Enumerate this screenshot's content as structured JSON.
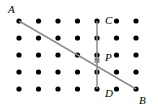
{
  "figure": {
    "type": "geometry-dot-grid",
    "width": 158,
    "height": 110,
    "background_color": "#ffffff",
    "grid": {
      "columns": 7,
      "rows": 5,
      "origin_x": 19,
      "origin_y": 21,
      "spacing_x": 19.5,
      "spacing_y": 17,
      "dot_radius": 2.6,
      "dot_color": "#000000"
    },
    "segments": [
      {
        "name": "segment-AB",
        "from": "A",
        "to": "B",
        "from_col": 1,
        "from_row": 1,
        "to_col": 7,
        "to_row": 5,
        "color": "#8c8c8c",
        "width": 1.5
      },
      {
        "name": "segment-CD",
        "from": "C",
        "to": "D",
        "from_col": 5,
        "from_row": 1,
        "to_col": 5,
        "to_row": 5,
        "color": "#8c8c8c",
        "width": 1.5
      }
    ],
    "intersection": {
      "name": "P",
      "col": 5,
      "row": 3,
      "offset_y": 5.3,
      "marker": "square",
      "marker_size": 5,
      "marker_color": "#8c8c8c"
    },
    "labels": [
      {
        "id": "A",
        "text": "A",
        "x": 8,
        "y": 4
      },
      {
        "id": "C",
        "text": "C",
        "x": 105,
        "y": 15
      },
      {
        "id": "P",
        "text": "P",
        "x": 105,
        "y": 52
      },
      {
        "id": "D",
        "text": "D",
        "x": 105,
        "y": 88
      },
      {
        "id": "B",
        "text": "B",
        "x": 139,
        "y": 95
      }
    ]
  }
}
